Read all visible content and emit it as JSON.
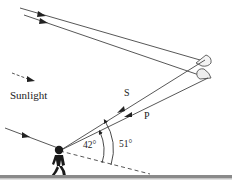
{
  "diagram": {
    "type": "rainbow-formation",
    "labels": {
      "sunlight": "Sunlight",
      "ray_s": "S",
      "ray_p": "P",
      "angle_inner": "42°",
      "angle_outer": "51°"
    },
    "angles": {
      "primary_rainbow_deg": 42,
      "secondary_rainbow_deg": 51
    },
    "colors": {
      "ray": "#333333",
      "ground": "#8a8a8a",
      "person": "#1a1a1a",
      "droplet": "#555555"
    },
    "elements": [
      "incoming-sunlight-rays",
      "raindrop-upper",
      "raindrop-lower",
      "ray-s",
      "ray-p",
      "observer",
      "antisolar-dashed-line",
      "angle-arc-42",
      "angle-arc-51",
      "ground"
    ]
  }
}
